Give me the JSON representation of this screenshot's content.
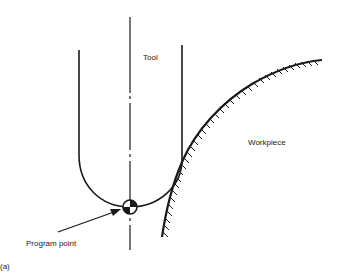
{
  "figure": {
    "panel_label": "(a)",
    "labels": {
      "tool": "Tool",
      "workpiece": "Workpiece",
      "program_point": "Program point"
    }
  },
  "colors": {
    "ink": "#1a1a1a",
    "background": "#ffffff"
  }
}
